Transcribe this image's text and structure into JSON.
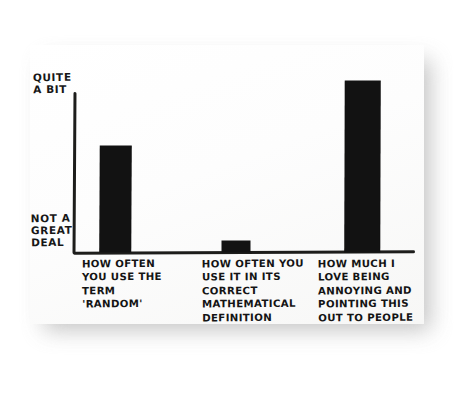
{
  "chart_data": {
    "type": "bar",
    "title": "",
    "subtitle": "",
    "xlabel": "",
    "ylabel": "",
    "grid": false,
    "legend": false,
    "style": "hand-drawn marker on white paper, photographed",
    "bar_color": "#121212",
    "axis_color": "#1d1d1b",
    "background_color": "#fdfdfd",
    "y_axis": {
      "tick_labels": [
        "NOT A GREAT DEAL",
        "QUITE A BIT"
      ],
      "top_label_lines": "QUITE\nA BIT",
      "bottom_label_lines": "NOT A\nGREAT\nDEAL",
      "ylim": [
        0,
        1
      ],
      "numeric_ticks_shown": false
    },
    "categories": [
      "HOW OFTEN YOU USE THE TERM 'RANDOM'",
      "HOW OFTEN YOU USE IT IN ITS CORRECT MATHEMATICAL DEFINITION",
      "HOW MUCH I LOVE BEING ANNOYING AND POINTING THIS OUT TO PEOPLE"
    ],
    "category_label_lines": [
      "HOW OFTEN\nYOU USE THE\nTERM\n'RANDOM'",
      "HOW OFTEN YOU\nUSE IT IN ITS\nCORRECT\nMATHEMATICAL\nDEFINITION",
      "HOW MUCH I\nLOVE BEING\nANNOYING AND\nPOINTING THIS\nOUT TO PEOPLE"
    ],
    "values": [
      0.66,
      0.07,
      1.07
    ],
    "value_note": "fraction of the axis height from 'NOT A GREAT DEAL' (0) to 'QUITE A BIT' (1); the third bar overshoots the top of the axis"
  },
  "photo": {
    "has_drop_shadow": true,
    "shadow_color": "#b9b9b9",
    "page_background": "#ffffff"
  }
}
